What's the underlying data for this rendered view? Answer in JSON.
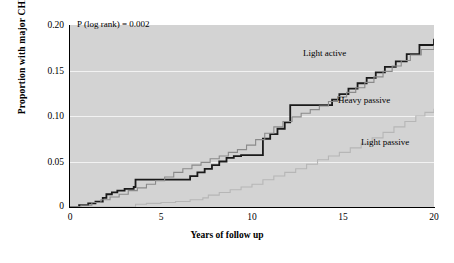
{
  "figure": {
    "annotation": "P (log rank) = 0.002",
    "background_color": "#d3d3d3",
    "gridline_color": "#f2f2f2"
  },
  "axes": {
    "ylabel": "Proportion with major CHD",
    "xlabel": "Years of follow up",
    "yticks": [
      "0.20",
      "0.15",
      "0.10",
      "0.05",
      "0"
    ],
    "xticks": [
      "0",
      "5",
      "10",
      "15",
      "20"
    ]
  },
  "labels": {
    "light_active": "Light active",
    "heavy_passive": "Heavy passive",
    "light_passive": "Light passive"
  },
  "chart_data": {
    "type": "line",
    "subtype": "kaplan-meier-step",
    "title": "",
    "xlabel": "Years of follow up",
    "ylabel": "Proportion with major CHD",
    "xlim": [
      0,
      20
    ],
    "ylim": [
      0,
      0.2
    ],
    "xticks": [
      0,
      5,
      10,
      15,
      20
    ],
    "yticks": [
      0,
      0.05,
      0.1,
      0.15,
      0.2
    ],
    "grid": "horizontal-white-gridlines",
    "legend": "inline-curve-annotations",
    "annotations": [
      {
        "text": "P (log rank) = 0.002",
        "x": 0.4,
        "y": 0.193
      }
    ],
    "series": [
      {
        "name": "Light active",
        "color": "#1a1a1a",
        "linewidth": 1.8,
        "step": "post",
        "x": [
          0.0,
          0.5,
          1.0,
          1.4,
          1.8,
          2.0,
          2.3,
          2.6,
          3.0,
          3.5,
          3.6,
          6.3,
          6.6,
          7.0,
          7.4,
          7.8,
          8.2,
          8.6,
          9.0,
          9.4,
          10.1,
          10.6,
          11.0,
          11.4,
          11.8,
          12.1,
          14.0,
          14.4,
          14.8,
          15.3,
          15.8,
          16.3,
          16.8,
          17.3,
          17.9,
          18.5,
          19.2,
          20.0
        ],
        "y": [
          0.0,
          0.002,
          0.004,
          0.006,
          0.01,
          0.014,
          0.016,
          0.018,
          0.02,
          0.022,
          0.03,
          0.03,
          0.034,
          0.038,
          0.042,
          0.046,
          0.05,
          0.054,
          0.056,
          0.057,
          0.057,
          0.075,
          0.08,
          0.086,
          0.093,
          0.112,
          0.112,
          0.118,
          0.124,
          0.13,
          0.136,
          0.142,
          0.148,
          0.154,
          0.16,
          0.168,
          0.178,
          0.185
        ]
      },
      {
        "name": "Heavy passive",
        "color": "#8a8a8a",
        "linewidth": 1.1,
        "step": "post",
        "x": [
          0.0,
          0.6,
          1.2,
          1.7,
          2.2,
          2.7,
          3.2,
          3.7,
          4.2,
          4.7,
          5.2,
          5.7,
          6.2,
          6.7,
          7.2,
          7.7,
          8.2,
          8.7,
          9.2,
          9.7,
          10.2,
          10.7,
          11.2,
          11.7,
          12.2,
          12.7,
          13.2,
          13.7,
          14.2,
          14.7,
          15.2,
          15.7,
          16.2,
          16.7,
          17.2,
          17.7,
          18.2,
          18.7,
          19.3,
          20.0
        ],
        "y": [
          0.0,
          0.002,
          0.005,
          0.008,
          0.011,
          0.014,
          0.018,
          0.021,
          0.025,
          0.029,
          0.033,
          0.038,
          0.042,
          0.046,
          0.049,
          0.053,
          0.056,
          0.06,
          0.063,
          0.068,
          0.074,
          0.081,
          0.088,
          0.094,
          0.099,
          0.103,
          0.107,
          0.111,
          0.116,
          0.121,
          0.126,
          0.131,
          0.137,
          0.143,
          0.149,
          0.155,
          0.161,
          0.167,
          0.173,
          0.178
        ]
      },
      {
        "name": "Light passive",
        "color": "#b6b6b6",
        "linewidth": 1.1,
        "step": "post",
        "x": [
          0.0,
          1.0,
          2.0,
          3.0,
          3.6,
          4.2,
          5.0,
          5.8,
          6.6,
          7.3,
          7.6,
          8.2,
          8.8,
          9.4,
          10.0,
          10.6,
          11.2,
          11.8,
          12.4,
          13.0,
          13.6,
          14.2,
          14.8,
          15.4,
          16.0,
          16.6,
          17.2,
          17.8,
          18.4,
          19.0,
          19.5,
          20.0
        ],
        "y": [
          0.0,
          0.0,
          0.0,
          0.0,
          0.003,
          0.004,
          0.005,
          0.006,
          0.008,
          0.01,
          0.013,
          0.016,
          0.019,
          0.022,
          0.025,
          0.03,
          0.034,
          0.038,
          0.042,
          0.047,
          0.052,
          0.056,
          0.06,
          0.065,
          0.07,
          0.076,
          0.082,
          0.088,
          0.094,
          0.1,
          0.104,
          0.108
        ]
      }
    ]
  }
}
